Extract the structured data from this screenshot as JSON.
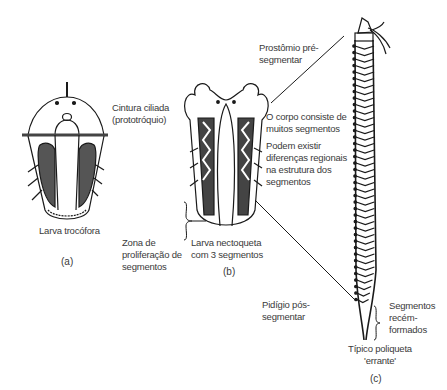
{
  "figure": {
    "panels": [
      {
        "id": "a",
        "tag": "(a)",
        "caption": "Larva trocófora"
      },
      {
        "id": "b",
        "tag": "(b)",
        "caption_lines": [
          "Larva nectoqueta",
          "com 3 segmentos"
        ]
      },
      {
        "id": "c",
        "tag": "(c)",
        "caption_lines": [
          "Típico poliqueta",
          "'errante'"
        ]
      }
    ],
    "labels": {
      "cintura": [
        "Cintura ciliada",
        "(prototróquio)"
      ],
      "zona": [
        "Zona de",
        "proliferação de",
        "segmentos"
      ],
      "prostomio": [
        "Prostômio pré-",
        "segmentar"
      ],
      "corpo": [
        "O corpo consiste de",
        "muitos segmentos"
      ],
      "diferencas": [
        "Podem existir",
        "diferenças regionais",
        "na estrutura dos",
        "segmentos"
      ],
      "pidigio": [
        "Pidígio pós-",
        "segmentar"
      ],
      "recem": [
        "Segmentos",
        "recém-",
        "formados"
      ]
    },
    "colors": {
      "ink": "#1a1a1a",
      "text": "#3a3a3a",
      "background": "#ffffff"
    }
  }
}
